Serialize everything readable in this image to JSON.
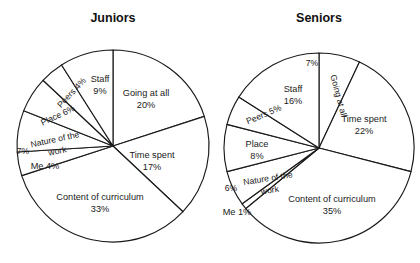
{
  "figure": {
    "width": 420,
    "height": 263,
    "background": "#ffffff",
    "stroke_color": "#1a1a1a",
    "text_color": "#1a1a1a"
  },
  "chart_data": [
    {
      "type": "pie",
      "title": "Juniors",
      "center": [
        113,
        146
      ],
      "radius": 96,
      "start_angle_deg": 0,
      "direction": "clockwise",
      "legend": "none",
      "grid": false,
      "categories": [
        "Going at all",
        "Time spent",
        "Content of curriculum",
        "Me",
        "Nature of the work",
        "Place",
        "Peers",
        "Staff"
      ],
      "values": [
        20,
        17,
        33,
        4,
        7,
        6,
        4,
        9
      ],
      "slices": [
        {
          "name": "Going at all",
          "percent": 20,
          "label_line1": "Going at all",
          "label_line2": "20%",
          "label_x": 146,
          "label_y": 94,
          "rotate": 0,
          "layout": "two-line"
        },
        {
          "name": "Time spent",
          "percent": 17,
          "label_line1": "Time spent",
          "label_line2": "17%",
          "label_x": 152,
          "label_y": 156,
          "rotate": 0,
          "layout": "two-line"
        },
        {
          "name": "Content of curriculum",
          "percent": 33,
          "label_line1": "Content of curriculum",
          "label_line2": "33%",
          "label_x": 100,
          "label_y": 198,
          "rotate": 0,
          "layout": "two-line"
        },
        {
          "name": "Me",
          "percent": 4,
          "label_line1": "Me 4%",
          "label_line2": "",
          "label_x": 45,
          "label_y": 167,
          "rotate": 0,
          "layout": "one-line"
        },
        {
          "name": "Nature of the work",
          "percent": 7,
          "label_line1": "Nature of the",
          "label_line2": "work",
          "label_x": 55,
          "label_y": 140,
          "rotate": -12,
          "layout": "two-line-rot"
        },
        {
          "name": "Nature of the work pct",
          "percent": 7,
          "label_line1": "7%",
          "label_line2": "",
          "label_x": 23,
          "label_y": 152,
          "rotate": 0,
          "layout": "pct-only"
        },
        {
          "name": "Place",
          "percent": 6,
          "label_line1": "Place  6%",
          "label_line2": "",
          "label_x": 58,
          "label_y": 116,
          "rotate": -25,
          "layout": "one-line-rot"
        },
        {
          "name": "Peers",
          "percent": 4,
          "label_line1": "Peers 4%",
          "label_line2": "",
          "label_x": 72,
          "label_y": 93,
          "rotate": -47,
          "layout": "one-line-rot"
        },
        {
          "name": "Staff",
          "percent": 9,
          "label_line1": "Staff",
          "label_line2": "9%",
          "label_x": 100,
          "label_y": 80,
          "rotate": 0,
          "layout": "two-line"
        }
      ],
      "title_x": 113,
      "title_y": 22
    },
    {
      "type": "pie",
      "title": "Seniors",
      "center": [
        319,
        148
      ],
      "radius": 95,
      "start_angle_deg": 0,
      "direction": "clockwise",
      "legend": "none",
      "grid": false,
      "categories": [
        "Going at all",
        "Time spent",
        "Content of curriculum",
        "Me",
        "Nature of the work",
        "Place",
        "Peers",
        "Staff"
      ],
      "values": [
        7,
        22,
        35,
        1,
        6,
        8,
        5,
        16
      ],
      "slices": [
        {
          "name": "Going at all",
          "percent": 7,
          "label_line1": "Going at all",
          "label_line2": "",
          "label_x": 338,
          "label_y": 96,
          "rotate": 75,
          "layout": "one-line-rot"
        },
        {
          "name": "Going at all pct",
          "percent": 7,
          "label_line1": "7%",
          "label_line2": "",
          "label_x": 312,
          "label_y": 64,
          "rotate": 0,
          "layout": "pct-only"
        },
        {
          "name": "Time spent",
          "percent": 22,
          "label_line1": "Time spent",
          "label_line2": "22%",
          "label_x": 364,
          "label_y": 120,
          "rotate": 0,
          "layout": "two-line"
        },
        {
          "name": "Content of curriculum",
          "percent": 35,
          "label_line1": "Content of curriculum",
          "label_line2": "35%",
          "label_x": 332,
          "label_y": 200,
          "rotate": 0,
          "layout": "two-line"
        },
        {
          "name": "Me",
          "percent": 1,
          "label_line1": "Me 1%",
          "label_line2": "",
          "label_x": 237,
          "label_y": 213,
          "rotate": 0,
          "layout": "one-line"
        },
        {
          "name": "Nature of the work",
          "percent": 6,
          "label_line1": "Nature of the",
          "label_line2": "work",
          "label_x": 268,
          "label_y": 179,
          "rotate": -9,
          "layout": "two-line-rot"
        },
        {
          "name": "Nature of the work pct",
          "percent": 6,
          "label_line1": "6%",
          "label_line2": "",
          "label_x": 231,
          "label_y": 189,
          "rotate": 0,
          "layout": "pct-only"
        },
        {
          "name": "Place",
          "percent": 8,
          "label_line1": "Place",
          "label_line2": "8%",
          "label_x": 257,
          "label_y": 145,
          "rotate": 0,
          "layout": "two-line"
        },
        {
          "name": "Peers",
          "percent": 5,
          "label_line1": "Peers 5%",
          "label_line2": "",
          "label_x": 264,
          "label_y": 115,
          "rotate": -23,
          "layout": "one-line-rot"
        },
        {
          "name": "Staff",
          "percent": 16,
          "label_line1": "Staff",
          "label_line2": "16%",
          "label_x": 293,
          "label_y": 90,
          "rotate": 0,
          "layout": "two-line"
        }
      ],
      "title_x": 319,
      "title_y": 22
    }
  ]
}
